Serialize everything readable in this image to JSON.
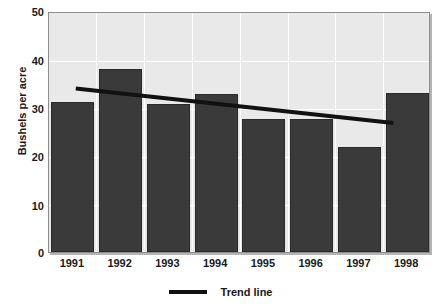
{
  "chart_data": {
    "type": "bar",
    "title": "",
    "subtitle": "",
    "xlabel": "",
    "ylabel": "Bushels per acre",
    "categories": [
      "1991",
      "1992",
      "1993",
      "1994",
      "1995",
      "1996",
      "1997",
      "1998"
    ],
    "values": [
      31.1,
      38.0,
      30.7,
      32.8,
      27.6,
      27.6,
      21.8,
      33.0
    ],
    "series": [
      {
        "name": "Bushels per acre",
        "type": "bar",
        "values": [
          31.1,
          38.0,
          30.7,
          32.8,
          27.6,
          27.6,
          21.8,
          33.0
        ]
      },
      {
        "name": "Trend line",
        "type": "line",
        "x": [
          "1991",
          "1998"
        ],
        "values": [
          34.2,
          27.0
        ],
        "endpoints": [
          {
            "x": "1991",
            "y": 34.2
          },
          {
            "x": "1998",
            "y": 27.0
          }
        ]
      }
    ],
    "ylim": [
      0,
      50
    ],
    "yticks": [
      0,
      10,
      20,
      30,
      40,
      50
    ],
    "ytick_labels": [
      "0",
      "10",
      "20",
      "30",
      "40",
      "50"
    ],
    "xtick_labels": [
      "1991",
      "1992",
      "1993",
      "1994",
      "1995",
      "1996",
      "1997",
      "1998"
    ],
    "grid": true,
    "grid_axis": "both",
    "grid_color": "#ffffff",
    "legend": [
      "Trend line"
    ],
    "legend_position": "bottom-center",
    "plot_background": "#e9e9e9",
    "bar_color": "#3a3a3a",
    "trend_line_color": "#111111",
    "annotations": []
  },
  "axes": {
    "y_title": "Bushels per acre",
    "y_ticks": [
      "50",
      "40",
      "30",
      "20",
      "10",
      "0"
    ],
    "x_ticks": [
      "1991",
      "1992",
      "1993",
      "1994",
      "1995",
      "1996",
      "1997",
      "1998"
    ]
  },
  "legend": {
    "swatch_name": "trend-line-swatch",
    "label": "Trend line"
  },
  "colors": {
    "bar": "#3a3a3a",
    "bar_border": "#2a2a2a",
    "plot_bg": "#e9e9e9",
    "grid": "#ffffff",
    "frame": "#8d8d8d",
    "shadow": "#b4b4b4",
    "trend": "#111111",
    "text": "#1a1a1a",
    "page_bg": "#ffffff"
  }
}
